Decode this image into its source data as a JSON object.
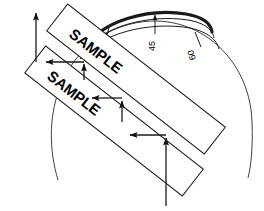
{
  "figure": {
    "type": "technical-line-drawing",
    "background_color": "#ffffff",
    "line_color": "#1a1a1a",
    "width": 264,
    "height": 211
  },
  "specimens": [
    {
      "id": "upper-sample",
      "label": "SAMPLE",
      "rotation_deg": 38,
      "x": 36,
      "y": 30,
      "w": 200,
      "h": 34
    },
    {
      "id": "lower-sample",
      "label": "SAMPLE",
      "rotation_deg": 38,
      "x": 14,
      "y": 70,
      "w": 200,
      "h": 34
    }
  ],
  "scale": {
    "name": "angular-protractor-arc",
    "ticks": [
      {
        "label": "30",
        "angle_deg": 30,
        "has_arrow": false
      },
      {
        "label": "45",
        "angle_deg": 45,
        "has_arrow": true
      },
      {
        "label": "60",
        "angle_deg": 60,
        "has_arrow": false
      }
    ],
    "arc_count": 3,
    "thick_arc_cap": "round"
  },
  "arrows": {
    "count": 7,
    "items": [
      {
        "id": "arrow-top-up",
        "direction": "up",
        "x1": 36,
        "y1": 52,
        "x2": 36,
        "y2": 12
      },
      {
        "id": "arrow-upper-left",
        "direction": "left",
        "x1": 84,
        "y1": 62,
        "x2": 45,
        "y2": 62
      },
      {
        "id": "arrow-upper-up",
        "direction": "up",
        "x1": 84,
        "y1": 78,
        "x2": 84,
        "y2": 64
      },
      {
        "id": "arrow-mid-left",
        "direction": "left",
        "x1": 122,
        "y1": 98,
        "x2": 90,
        "y2": 98
      },
      {
        "id": "arrow-mid-up",
        "direction": "up",
        "x1": 122,
        "y1": 120,
        "x2": 122,
        "y2": 100
      },
      {
        "id": "arrow-lower-left",
        "direction": "left",
        "x1": 166,
        "y1": 135,
        "x2": 128,
        "y2": 135
      },
      {
        "id": "arrow-bottom-up",
        "direction": "up",
        "x1": 166,
        "y1": 205,
        "x2": 166,
        "y2": 137
      }
    ]
  },
  "circles": [
    {
      "id": "outer-guide-arc",
      "stroke": "#1a1a1a",
      "width": 0.8
    }
  ]
}
